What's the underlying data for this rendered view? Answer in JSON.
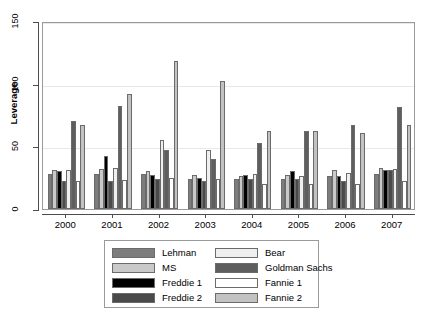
{
  "chart_data": {
    "type": "bar",
    "title": "",
    "xlabel": "",
    "ylabel": "Leverage",
    "ylim": [
      0,
      150
    ],
    "yticks": [
      0,
      50,
      100,
      150
    ],
    "grid": true,
    "legend_position": "below-center",
    "categories": [
      "2000",
      "2001",
      "2002",
      "2003",
      "2004",
      "2005",
      "2006",
      "2007"
    ],
    "series": [
      {
        "name": "Lehman",
        "color": "#7d7d7d",
        "values": [
          28,
          28,
          28,
          24,
          24,
          24,
          26,
          28
        ]
      },
      {
        "name": "MS",
        "color": "#c9c9c9",
        "values": [
          31,
          32,
          30,
          27,
          26,
          27,
          31,
          33
        ]
      },
      {
        "name": "Freddie 1",
        "color": "#000000",
        "values": [
          30,
          42,
          27,
          25,
          27,
          30,
          26,
          31
        ]
      },
      {
        "name": "Freddie 2",
        "color": "#4a4a4a",
        "values": [
          22,
          22,
          24,
          22,
          24,
          24,
          22,
          31
        ]
      },
      {
        "name": "Bear",
        "color": "#efefef",
        "values": [
          31,
          33,
          55,
          47,
          28,
          26,
          29,
          32
        ]
      },
      {
        "name": "Goldman Sachs",
        "color": "#5e5e5e",
        "values": [
          70,
          82,
          47,
          40,
          53,
          62,
          67,
          81
        ]
      },
      {
        "name": "Fannie 1",
        "color": "#ffffff",
        "values": [
          22,
          23,
          25,
          24,
          20,
          20,
          20,
          22
        ]
      },
      {
        "name": "Fannie 2",
        "color": "#c2c2c2",
        "values": [
          67,
          92,
          118,
          102,
          62,
          62,
          61,
          67
        ]
      }
    ]
  },
  "legend": {
    "entries": [
      {
        "label": "Lehman"
      },
      {
        "label": "MS"
      },
      {
        "label": "Freddie 1"
      },
      {
        "label": "Freddie 2"
      },
      {
        "label": "Bear"
      },
      {
        "label": "Goldman Sachs"
      },
      {
        "label": "Fannie 1"
      },
      {
        "label": "Fannie 2"
      }
    ]
  }
}
